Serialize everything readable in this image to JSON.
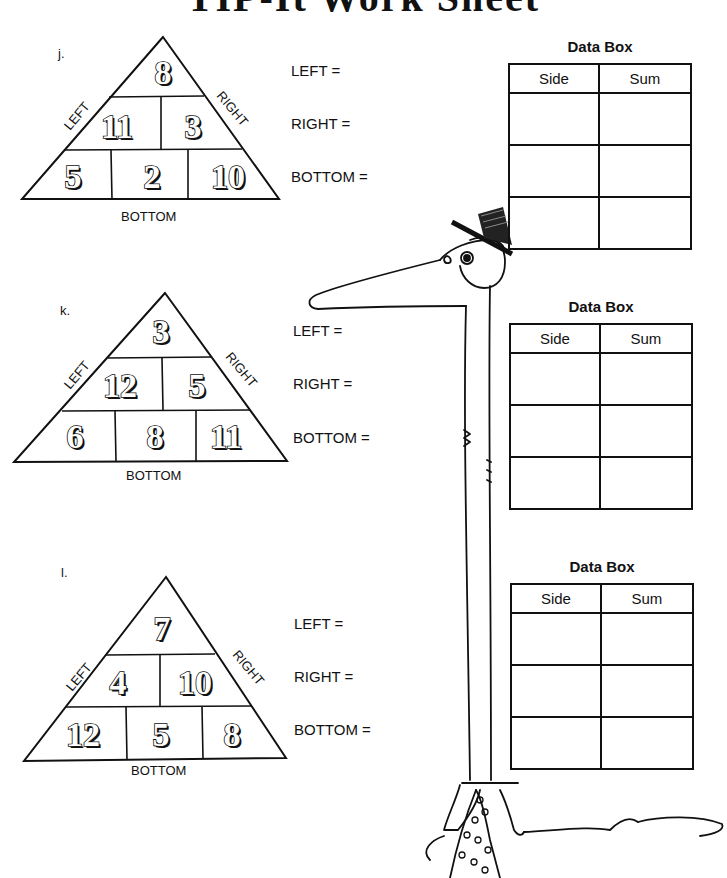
{
  "title": "TIP-It Work Sheet",
  "side_labels": {
    "left": "LEFT",
    "right": "RIGHT",
    "bottom": "BOTTOM"
  },
  "equations": {
    "left": "LEFT =",
    "right": "RIGHT =",
    "bottom": "BOTTOM ="
  },
  "data_box": {
    "title": "Data Box",
    "columns": [
      "Side",
      "Sum"
    ],
    "rows": [
      [
        "",
        ""
      ],
      [
        "",
        ""
      ],
      [
        "",
        ""
      ]
    ]
  },
  "problems": [
    {
      "letter": "j.",
      "top": "8",
      "middle": [
        "11",
        "3"
      ],
      "bottom": [
        "5",
        "2",
        "10"
      ]
    },
    {
      "letter": "k.",
      "top": "3",
      "middle": [
        "12",
        "5"
      ],
      "bottom": [
        "6",
        "8",
        "11"
      ]
    },
    {
      "letter": "l.",
      "top": "7",
      "middle": [
        "4",
        "10"
      ],
      "bottom": [
        "12",
        "5",
        "8"
      ]
    }
  ]
}
